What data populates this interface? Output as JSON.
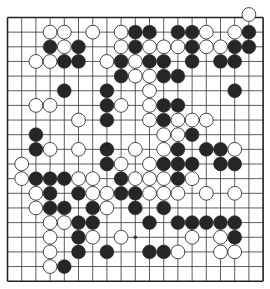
{
  "board": {
    "size": 19,
    "origin_x": 7.5,
    "origin_y": 17.5,
    "spacing_x": 14.2,
    "spacing_y": 14.65,
    "line_color": "#333333",
    "edge_color": "#222222",
    "background": "#ffffff",
    "stone_radius": 6.9,
    "black_color": "#262626",
    "white_color": "#ffffff",
    "white_stroke": "#333333",
    "star_points": [
      [
        15,
        9
      ]
    ],
    "stones": [
      {
        "color": "W",
        "row": 0,
        "col": 17,
        "offset_y": -3
      },
      {
        "color": "W",
        "row": 1,
        "col": 3
      },
      {
        "color": "W",
        "row": 1,
        "col": 4
      },
      {
        "color": "W",
        "row": 1,
        "col": 6
      },
      {
        "color": "W",
        "row": 1,
        "col": 8
      },
      {
        "color": "B",
        "row": 1,
        "col": 9
      },
      {
        "color": "B",
        "row": 1,
        "col": 10
      },
      {
        "color": "B",
        "row": 1,
        "col": 12
      },
      {
        "color": "B",
        "row": 1,
        "col": 13
      },
      {
        "color": "W",
        "row": 1,
        "col": 14
      },
      {
        "color": "W",
        "row": 1,
        "col": 16
      },
      {
        "color": "B",
        "row": 1,
        "col": 17
      },
      {
        "color": "B",
        "row": 2,
        "col": 3
      },
      {
        "color": "W",
        "row": 2,
        "col": 4
      },
      {
        "color": "B",
        "row": 2,
        "col": 5
      },
      {
        "color": "W",
        "row": 2,
        "col": 8
      },
      {
        "color": "B",
        "row": 2,
        "col": 9
      },
      {
        "color": "W",
        "row": 2,
        "col": 10
      },
      {
        "color": "W",
        "row": 2,
        "col": 11
      },
      {
        "color": "W",
        "row": 2,
        "col": 12
      },
      {
        "color": "B",
        "row": 2,
        "col": 13
      },
      {
        "color": "W",
        "row": 2,
        "col": 14
      },
      {
        "color": "W",
        "row": 2,
        "col": 15
      },
      {
        "color": "B",
        "row": 2,
        "col": 16
      },
      {
        "color": "B",
        "row": 2,
        "col": 17
      },
      {
        "color": "W",
        "row": 3,
        "col": 2
      },
      {
        "color": "W",
        "row": 3,
        "col": 3
      },
      {
        "color": "B",
        "row": 3,
        "col": 4
      },
      {
        "color": "B",
        "row": 3,
        "col": 5
      },
      {
        "color": "W",
        "row": 3,
        "col": 7
      },
      {
        "color": "B",
        "row": 3,
        "col": 8
      },
      {
        "color": "W",
        "row": 3,
        "col": 9
      },
      {
        "color": "B",
        "row": 3,
        "col": 10
      },
      {
        "color": "B",
        "row": 3,
        "col": 11
      },
      {
        "color": "B",
        "row": 3,
        "col": 13
      },
      {
        "color": "B",
        "row": 3,
        "col": 15
      },
      {
        "color": "B",
        "row": 3,
        "col": 16
      },
      {
        "color": "B",
        "row": 4,
        "col": 8
      },
      {
        "color": "W",
        "row": 4,
        "col": 9
      },
      {
        "color": "W",
        "row": 4,
        "col": 10
      },
      {
        "color": "B",
        "row": 4,
        "col": 11
      },
      {
        "color": "B",
        "row": 4,
        "col": 12
      },
      {
        "color": "B",
        "row": 5,
        "col": 4
      },
      {
        "color": "B",
        "row": 5,
        "col": 7
      },
      {
        "color": "W",
        "row": 5,
        "col": 10
      },
      {
        "color": "B",
        "row": 5,
        "col": 16
      },
      {
        "color": "W",
        "row": 6,
        "col": 2
      },
      {
        "color": "W",
        "row": 6,
        "col": 3
      },
      {
        "color": "B",
        "row": 6,
        "col": 7
      },
      {
        "color": "W",
        "row": 6,
        "col": 8
      },
      {
        "color": "W",
        "row": 6,
        "col": 10
      },
      {
        "color": "B",
        "row": 6,
        "col": 11
      },
      {
        "color": "B",
        "row": 6,
        "col": 12
      },
      {
        "color": "W",
        "row": 7,
        "col": 5
      },
      {
        "color": "B",
        "row": 7,
        "col": 7
      },
      {
        "color": "W",
        "row": 7,
        "col": 10
      },
      {
        "color": "B",
        "row": 7,
        "col": 11
      },
      {
        "color": "W",
        "row": 7,
        "col": 12
      },
      {
        "color": "W",
        "row": 7,
        "col": 13
      },
      {
        "color": "W",
        "row": 7,
        "col": 14
      },
      {
        "color": "B",
        "row": 8,
        "col": 2
      },
      {
        "color": "W",
        "row": 8,
        "col": 11
      },
      {
        "color": "W",
        "row": 8,
        "col": 12
      },
      {
        "color": "B",
        "row": 8,
        "col": 13
      },
      {
        "color": "B",
        "row": 9,
        "col": 2
      },
      {
        "color": "W",
        "row": 9,
        "col": 3
      },
      {
        "color": "W",
        "row": 9,
        "col": 5
      },
      {
        "color": "B",
        "row": 9,
        "col": 7
      },
      {
        "color": "W",
        "row": 9,
        "col": 9
      },
      {
        "color": "W",
        "row": 9,
        "col": 11
      },
      {
        "color": "B",
        "row": 9,
        "col": 12
      },
      {
        "color": "B",
        "row": 9,
        "col": 14
      },
      {
        "color": "B",
        "row": 9,
        "col": 15
      },
      {
        "color": "W",
        "row": 9,
        "col": 16
      },
      {
        "color": "W",
        "row": 10,
        "col": 1
      },
      {
        "color": "B",
        "row": 10,
        "col": 7
      },
      {
        "color": "W",
        "row": 10,
        "col": 8
      },
      {
        "color": "W",
        "row": 10,
        "col": 10
      },
      {
        "color": "B",
        "row": 10,
        "col": 11
      },
      {
        "color": "B",
        "row": 10,
        "col": 12
      },
      {
        "color": "B",
        "row": 10,
        "col": 13
      },
      {
        "color": "B",
        "row": 10,
        "col": 15
      },
      {
        "color": "B",
        "row": 10,
        "col": 16
      },
      {
        "color": "W",
        "row": 11,
        "col": 1
      },
      {
        "color": "B",
        "row": 11,
        "col": 2
      },
      {
        "color": "B",
        "row": 11,
        "col": 3
      },
      {
        "color": "B",
        "row": 11,
        "col": 4
      },
      {
        "color": "W",
        "row": 11,
        "col": 5
      },
      {
        "color": "W",
        "row": 11,
        "col": 6
      },
      {
        "color": "B",
        "row": 11,
        "col": 8
      },
      {
        "color": "W",
        "row": 11,
        "col": 9
      },
      {
        "color": "W",
        "row": 11,
        "col": 10
      },
      {
        "color": "W",
        "row": 11,
        "col": 11
      },
      {
        "color": "B",
        "row": 11,
        "col": 12
      },
      {
        "color": "W",
        "row": 11,
        "col": 13
      },
      {
        "color": "W",
        "row": 12,
        "col": 2
      },
      {
        "color": "B",
        "row": 12,
        "col": 3
      },
      {
        "color": "B",
        "row": 12,
        "col": 5
      },
      {
        "color": "W",
        "row": 12,
        "col": 6
      },
      {
        "color": "W",
        "row": 12,
        "col": 7
      },
      {
        "color": "B",
        "row": 12,
        "col": 8
      },
      {
        "color": "B",
        "row": 12,
        "col": 9
      },
      {
        "color": "W",
        "row": 12,
        "col": 10
      },
      {
        "color": "W",
        "row": 12,
        "col": 11
      },
      {
        "color": "W",
        "row": 12,
        "col": 12
      },
      {
        "color": "W",
        "row": 12,
        "col": 14
      },
      {
        "color": "W",
        "row": 12,
        "col": 16
      },
      {
        "color": "W",
        "row": 13,
        "col": 2
      },
      {
        "color": "B",
        "row": 13,
        "col": 3
      },
      {
        "color": "B",
        "row": 13,
        "col": 4
      },
      {
        "color": "B",
        "row": 13,
        "col": 6
      },
      {
        "color": "W",
        "row": 13,
        "col": 7
      },
      {
        "color": "B",
        "row": 13,
        "col": 9
      },
      {
        "color": "B",
        "row": 13,
        "col": 11
      },
      {
        "color": "W",
        "row": 14,
        "col": 3
      },
      {
        "color": "W",
        "row": 14,
        "col": 4
      },
      {
        "color": "B",
        "row": 14,
        "col": 5
      },
      {
        "color": "B",
        "row": 14,
        "col": 6
      },
      {
        "color": "B",
        "row": 14,
        "col": 10
      },
      {
        "color": "B",
        "row": 14,
        "col": 12
      },
      {
        "color": "B",
        "row": 14,
        "col": 13
      },
      {
        "color": "B",
        "row": 14,
        "col": 14
      },
      {
        "color": "B",
        "row": 14,
        "col": 15
      },
      {
        "color": "B",
        "row": 14,
        "col": 16
      },
      {
        "color": "W",
        "row": 15,
        "col": 3
      },
      {
        "color": "B",
        "row": 15,
        "col": 5
      },
      {
        "color": "W",
        "row": 15,
        "col": 6
      },
      {
        "color": "W",
        "row": 15,
        "col": 8
      },
      {
        "color": "W",
        "row": 15,
        "col": 13
      },
      {
        "color": "W",
        "row": 15,
        "col": 15
      },
      {
        "color": "B",
        "row": 15,
        "col": 16
      },
      {
        "color": "W",
        "row": 16,
        "col": 3
      },
      {
        "color": "B",
        "row": 16,
        "col": 5
      },
      {
        "color": "B",
        "row": 16,
        "col": 7
      },
      {
        "color": "B",
        "row": 16,
        "col": 10
      },
      {
        "color": "B",
        "row": 16,
        "col": 11
      },
      {
        "color": "W",
        "row": 16,
        "col": 12
      },
      {
        "color": "W",
        "row": 16,
        "col": 15
      },
      {
        "color": "W",
        "row": 16,
        "col": 16
      },
      {
        "color": "W",
        "row": 17,
        "col": 3
      },
      {
        "color": "B",
        "row": 17,
        "col": 4
      }
    ]
  }
}
